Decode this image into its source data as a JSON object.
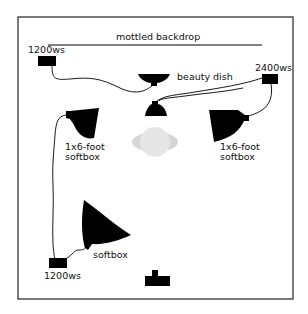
{
  "diagram": {
    "type": "studio-lighting-diagram",
    "backdrop_label": "mottled backdrop",
    "colors": {
      "ink": "#000000",
      "subject": "#d8d8d8",
      "subject_center": "#e8e8e8",
      "border": "#222222"
    },
    "power_packs": [
      {
        "id": "pack-top-left",
        "label": "1200ws"
      },
      {
        "id": "pack-top-right",
        "label": "2400ws"
      },
      {
        "id": "pack-bottom-left",
        "label": "1200ws"
      }
    ],
    "lights": [
      {
        "id": "beauty-dish",
        "label": "beauty dish"
      },
      {
        "id": "softbox-left",
        "label_line1": "1x6-foot",
        "label_line2": "softbox"
      },
      {
        "id": "softbox-right",
        "label_line1": "1x6-foot",
        "label_line2": "softbox"
      },
      {
        "id": "softbox-front",
        "label": "softbox"
      }
    ],
    "subject": {
      "label": ""
    },
    "camera": {
      "label": ""
    }
  }
}
